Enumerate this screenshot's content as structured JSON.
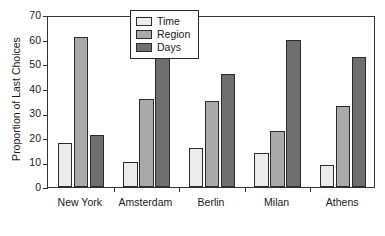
{
  "chart_data": {
    "type": "bar",
    "title": "",
    "xlabel": "",
    "ylabel": "Proportion of Last Choices",
    "ylim": [
      0,
      70
    ],
    "yticks": [
      0,
      10,
      20,
      30,
      40,
      50,
      60,
      70
    ],
    "grid": false,
    "legend_position": "top-center",
    "categories": [
      "New York",
      "Amsterdam",
      "Berlin",
      "Milan",
      "Athens"
    ],
    "series": [
      {
        "name": "Time",
        "color": "#ececec",
        "values": [
          18,
          10,
          16,
          14,
          9
        ]
      },
      {
        "name": "Region",
        "color": "#a9a9a9",
        "values": [
          61,
          36,
          35,
          23,
          33
        ]
      },
      {
        "name": "Days",
        "color": "#6f6f6f",
        "values": [
          21,
          53,
          46,
          60,
          53
        ]
      }
    ]
  },
  "axis": {
    "y_title": "Proportion of Last Choices",
    "tick_labels": [
      "0",
      "10",
      "20",
      "30",
      "40",
      "50",
      "60",
      "70"
    ]
  },
  "legend": {
    "entries": [
      {
        "label": "Time"
      },
      {
        "label": "Region"
      },
      {
        "label": "Days"
      }
    ]
  }
}
